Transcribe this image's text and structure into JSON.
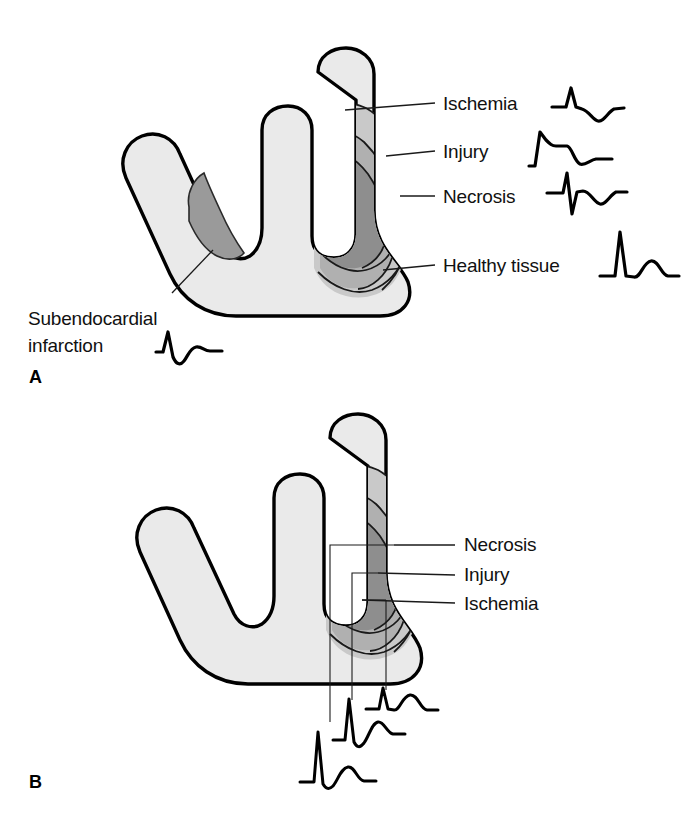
{
  "figure": {
    "background_color": "#ffffff",
    "outline_color": "#000000"
  },
  "palette": {
    "healthy_tissue": "#eaeaea",
    "ischemia_zone": "#c9c9c9",
    "injury_zone": "#b0b0b0",
    "necrosis_zone": "#8e8e8e",
    "subendocardial_infarct": "#9a9a9a",
    "line": "#1a1a1a",
    "text": "#111111"
  },
  "panels": [
    {
      "id": "A",
      "letter": "A",
      "labels": [
        {
          "key": "ischemia",
          "text": "Ischemia"
        },
        {
          "key": "injury",
          "text": "Injury"
        },
        {
          "key": "necrosis",
          "text": "Necrosis"
        },
        {
          "key": "healthy",
          "text": "Healthy tissue"
        }
      ],
      "caption_lines": [
        "Subendocardial",
        "infarction"
      ],
      "waveforms": [
        {
          "key": "ischemia",
          "name": "ischemia-ecg",
          "description": "Normal R wave with symmetrically inverted T wave"
        },
        {
          "key": "injury",
          "name": "injury-ecg",
          "description": "R wave with elevated ST segment plateau"
        },
        {
          "key": "necrosis",
          "name": "necrosis-ecg",
          "description": "Deep pathologic Q wave with inverted T wave"
        },
        {
          "key": "healthy",
          "name": "healthy-tissue-ecg",
          "description": "Tall R wave with upright T wave"
        },
        {
          "key": "subendocardial",
          "name": "subendocardial-infarction-ecg",
          "description": "R wave with depressed ST segment"
        }
      ]
    },
    {
      "id": "B",
      "letter": "B",
      "labels": [
        {
          "key": "necrosis",
          "text": "Necrosis"
        },
        {
          "key": "injury",
          "text": "Injury"
        },
        {
          "key": "ischemia",
          "text": "Ischemia"
        }
      ],
      "waveforms": [
        {
          "key": "necrosis",
          "name": "necrosis-probe-ecg",
          "description": "Tall R wave with small upright T wave recorded over necrosis"
        },
        {
          "key": "injury",
          "name": "injury-probe-ecg",
          "description": "R wave with ST elevation recorded over injury zone"
        },
        {
          "key": "ischemia",
          "name": "ischemia-probe-ecg",
          "description": "Small R wave with broad T wave recorded over ischemia zone"
        }
      ]
    }
  ]
}
